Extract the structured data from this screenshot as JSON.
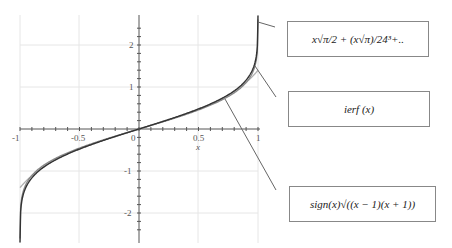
{
  "chart_data": {
    "type": "line",
    "title": "",
    "xlabel": "x",
    "ylabel": "",
    "xlim": [
      -1,
      1
    ],
    "ylim": [
      -2.7,
      2.7
    ],
    "grid": true,
    "x_ticks": [
      "-1",
      "-0.5",
      "0",
      "0.5",
      "1"
    ],
    "y_ticks": [
      "2",
      "1",
      "-1",
      "-2"
    ],
    "series": [
      {
        "name": "x√π/2 + (x√π)/24³+..",
        "description": "series approximation of inverse error function",
        "color": "#aaaaaa"
      },
      {
        "name": "ierf (x)",
        "description": "inverse error function",
        "color": "#444444"
      },
      {
        "name": "sign(x)√((x − 1)(x + 1))",
        "description": "approximation",
        "color": "#777777"
      }
    ],
    "annotations": [
      {
        "text": "x√π/2 + (x√π)/24³+..",
        "points_to": [
          0.99,
          2.55
        ]
      },
      {
        "text": "ierf (x)",
        "points_to": [
          0.98,
          1.45
        ]
      },
      {
        "text": "sign(x)√((x − 1)(x + 1))",
        "points_to": [
          0.72,
          0.72
        ]
      }
    ]
  },
  "labels": {
    "series1": "x√π/2 + (x√π)/24³+..",
    "series2": "ierf (x)",
    "series3": "sign(x)√((x − 1)(x + 1))"
  },
  "axis": {
    "xlabel": "x",
    "xt_m1": "-1",
    "xt_m05": "-0.5",
    "xt_0": "0",
    "xt_05": "0.5",
    "xt_1": "1",
    "yt_2": "2",
    "yt_1": "1",
    "yt_m1": "-1",
    "yt_m2": "-2"
  }
}
